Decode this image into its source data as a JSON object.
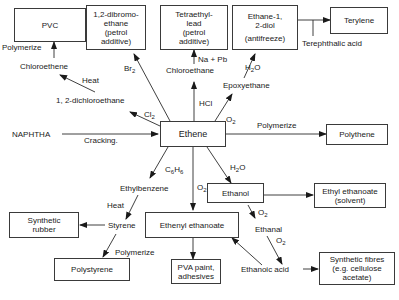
{
  "center": {
    "label": "Ethene"
  },
  "boxes": {
    "pvc": {
      "lines": [
        "PVC"
      ]
    },
    "dibromo": {
      "lines": [
        "1,2-dibromo-",
        "ethane",
        "(petrol",
        "additive)"
      ]
    },
    "tel": {
      "lines": [
        "Tetraethyl-",
        "lead",
        "(petrol",
        "additive)"
      ]
    },
    "diol": {
      "lines": [
        "Ethane-1,",
        "2-diol",
        "(antifreeze)"
      ]
    },
    "terylene": {
      "lines": [
        "Terylene"
      ]
    },
    "polythene": {
      "lines": [
        "Polythene"
      ]
    },
    "ethanol": {
      "lines": [
        "Ethanol"
      ]
    },
    "ethyl_ethanoate": {
      "lines": [
        "Ethyl ethanoate",
        "(solvent)"
      ]
    },
    "synthetic_rubber": {
      "lines": [
        "Synthetic",
        "rubber"
      ]
    },
    "ethenyl_ethanoate": {
      "lines": [
        "Ethenyl ethanoate"
      ]
    },
    "polystyrene": {
      "lines": [
        "Polystyrene"
      ]
    },
    "pva": {
      "lines": [
        "PVA paint,",
        "adhesives"
      ]
    },
    "synthetic_fibres": {
      "lines": [
        "Synthetic fibres",
        "(e.g. cellulose",
        "acetate)"
      ]
    }
  },
  "labels": {
    "naphtha": "NAPHTHA",
    "cracking": "Cracking.",
    "polymerize_pvc": "Polymerize",
    "chloroethene": "Chloroethene",
    "heat_1": "Heat",
    "dichloroethane": "1, 2-dichloroethane",
    "cl2": "Cl",
    "br2": "Br",
    "na_pb": "Na + Pb",
    "chloroethane": "Chloroethane",
    "hcl": "HCl",
    "h2o_top": "H",
    "epoxyethane": "Epoxyethane",
    "o2_top": "O",
    "terephthalic": "Terephthalic acid",
    "polymerize_pe": "Polymerize",
    "c6h6": "C",
    "o2_mid": "O",
    "h2o_mid": "H",
    "ethylbenzene": "Ethylbenzene",
    "heat_2": "Heat",
    "styrene": "Styrene",
    "polymerize_ps": "Polymerize",
    "o2_ethanol": "O",
    "ethanal": "Ethanal",
    "o2_ethanal": "O",
    "ethanoic_acid": "Ethanoic acid"
  }
}
